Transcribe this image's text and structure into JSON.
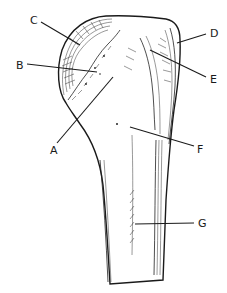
{
  "figure": {
    "labels": [
      {
        "id": "A",
        "text": "A",
        "x": 50,
        "y": 154,
        "line": [
          57,
          143,
          113,
          77
        ]
      },
      {
        "id": "B",
        "text": "B",
        "x": 16,
        "y": 69,
        "line": [
          27,
          64,
          97,
          72
        ]
      },
      {
        "id": "C",
        "text": "C",
        "x": 30,
        "y": 24,
        "line": [
          41,
          22,
          80,
          45
        ]
      },
      {
        "id": "D",
        "text": "D",
        "x": 210,
        "y": 37,
        "line": [
          206,
          34,
          177,
          43
        ]
      },
      {
        "id": "E",
        "text": "E",
        "x": 210,
        "y": 83,
        "line": [
          206,
          77,
          150,
          50
        ]
      },
      {
        "id": "F",
        "text": "F",
        "x": 197,
        "y": 153,
        "line": [
          194,
          146,
          130,
          127
        ]
      },
      {
        "id": "G",
        "text": "G",
        "x": 198,
        "y": 227,
        "line": [
          194,
          223,
          135,
          224
        ]
      }
    ]
  },
  "colors": {
    "ink": "#1a1a1a",
    "background": "#ffffff"
  }
}
